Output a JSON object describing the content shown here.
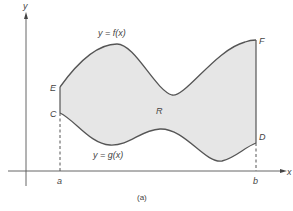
{
  "diagram": {
    "caption": "(a)",
    "region_label": "R",
    "colors": {
      "region_fill": "#e6e6e6",
      "curve_stroke": "#555555",
      "axis_stroke": "#555555",
      "label_color": "#444444"
    },
    "axes": {
      "x_label": "x",
      "y_label": "y"
    },
    "bounds": {
      "left_label": "a",
      "right_label": "b"
    },
    "curves": {
      "upper": {
        "label": "y = f(x)"
      },
      "lower": {
        "label": "y = g(x)"
      }
    },
    "points": {
      "E": "E",
      "C": "C",
      "F": "F",
      "D": "D"
    }
  }
}
